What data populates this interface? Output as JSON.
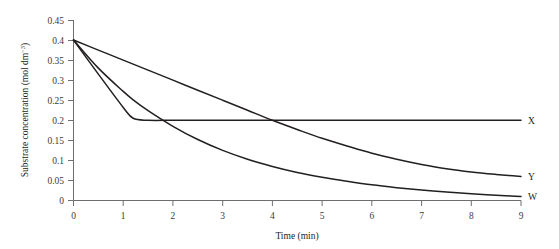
{
  "chart_data": {
    "type": "line",
    "title": "",
    "xlabel": "Time (min)",
    "ylabel": "Substrate concentration (mol dm⁻³)",
    "ylabel_main": "Substrate concentration (mol dm",
    "ylabel_exponent": "−3",
    "ylabel_tail": ")",
    "xlim": [
      0,
      9
    ],
    "ylim": [
      0,
      0.45
    ],
    "grid": false,
    "legend_position": "right-inline-labels",
    "xticks": [
      "0",
      "1",
      "2",
      "3",
      "4",
      "5",
      "6",
      "7",
      "8",
      "9"
    ],
    "xtick_values": [
      0,
      1,
      2,
      3,
      4,
      5,
      6,
      7,
      8,
      9
    ],
    "yticks": [
      "0",
      "0.05",
      "0.1",
      "0.15",
      "0.2",
      "0.25",
      "0.3",
      "0.35",
      "0.4",
      "0.45"
    ],
    "ytick_values": [
      0,
      0.05,
      0.1,
      0.15,
      0.2,
      0.25,
      0.3,
      0.35,
      0.4,
      0.45
    ],
    "x": [
      0,
      0.5,
      1,
      1.2,
      1.5,
      2,
      2.5,
      3,
      3.5,
      4,
      4.5,
      5,
      5.5,
      6,
      6.5,
      7,
      7.5,
      8,
      8.5,
      9
    ],
    "series": [
      {
        "name": "X",
        "label": "X",
        "color": "#231f20",
        "values": [
          0.4,
          0.315,
          0.232,
          0.205,
          0.2,
          0.2,
          0.2,
          0.2,
          0.2,
          0.2,
          0.2,
          0.2,
          0.2,
          0.2,
          0.2,
          0.2,
          0.2,
          0.2,
          0.2,
          0.2
        ]
      },
      {
        "name": "Y",
        "label": "Y",
        "color": "#231f20",
        "values": [
          0.4,
          0.375,
          0.35,
          0.34,
          0.325,
          0.3,
          0.275,
          0.25,
          0.225,
          0.2,
          0.177,
          0.155,
          0.136,
          0.118,
          0.103,
          0.09,
          0.079,
          0.071,
          0.065,
          0.06
        ]
      },
      {
        "name": "W",
        "label": "W",
        "color": "#231f20",
        "values": [
          0.4,
          0.33,
          0.272,
          0.251,
          0.224,
          0.185,
          0.152,
          0.125,
          0.103,
          0.085,
          0.07,
          0.058,
          0.048,
          0.039,
          0.032,
          0.026,
          0.021,
          0.017,
          0.013,
          0.01
        ]
      }
    ],
    "annotations": [
      {
        "text": "X plateaus at 0.20 from about t = 1.2 min onward"
      },
      {
        "text": "Y crosses the X plateau at t = 4 min"
      },
      {
        "text": "All three curves start at 0.40 mol dm⁻³ at t = 0"
      }
    ]
  }
}
